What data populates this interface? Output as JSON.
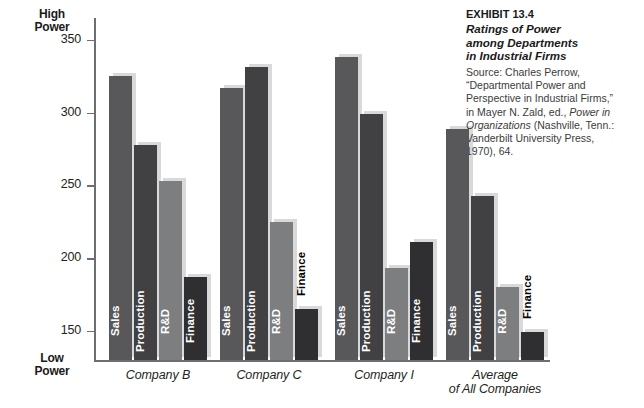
{
  "axis": {
    "top_cap": "High\nPower",
    "top_cap_line1": "High",
    "top_cap_line2": "Power",
    "bottom_cap_line1": "Low",
    "bottom_cap_line2": "Power",
    "ticks": [
      "350",
      "300",
      "250",
      "200",
      "150"
    ]
  },
  "exhibit": {
    "number": "EXHIBIT 13.4",
    "title_line1": "Ratings of Power",
    "title_line2": "among Departments",
    "title_line3": "in Industrial Firms",
    "source_l1": "Source: Charles Perrow,",
    "source_l2": "“Departmental Power and",
    "source_l3": "Perspective in Industrial Firms,”",
    "source_l4a": "in Mayer N. Zald, ed., ",
    "source_l4b": "Power in",
    "source_l5a": "Organizations",
    "source_l5b": " (Nashville, Tenn.:",
    "source_l6": "Vanderbilt University Press,",
    "source_l7": "1970), 64."
  },
  "colors": {
    "sales": "#58585a",
    "production": "#414042",
    "rnd": "#7d7e80",
    "finance": "#2f2f31",
    "shadow": "#d9d9d9",
    "axis": "#6d6e71",
    "text": "#231f20"
  },
  "chart_data": {
    "type": "bar",
    "title": "Ratings of Power among Departments in Industrial Firms",
    "xlabel": "",
    "ylabel": "Power (High Power / Low Power)",
    "ylim": [
      130,
      365
    ],
    "yticks": [
      150,
      200,
      250,
      300,
      350
    ],
    "grid": false,
    "legend": "none",
    "categories": [
      "Company B",
      "Company C",
      "Company I",
      "Average of All Companies"
    ],
    "series": [
      {
        "name": "Sales",
        "values": [
          325,
          317,
          338,
          289
        ]
      },
      {
        "name": "Production",
        "values": [
          278,
          331,
          299,
          243
        ]
      },
      {
        "name": "R&D",
        "values": [
          253,
          225,
          193,
          180
        ]
      },
      {
        "name": "Finance",
        "values": [
          187,
          165,
          211,
          149
        ]
      }
    ],
    "label_placement": {
      "Company B": [
        "inside",
        "inside",
        "inside",
        "inside"
      ],
      "Company C": [
        "inside",
        "inside",
        "inside",
        "outside"
      ],
      "Company I": [
        "inside",
        "inside",
        "inside",
        "inside"
      ],
      "Average of All Companies": [
        "inside",
        "inside",
        "inside",
        "outside"
      ]
    }
  },
  "groups": [
    {
      "caption_l1": "Company B",
      "caption_l2": ""
    },
    {
      "caption_l1": "Company C",
      "caption_l2": ""
    },
    {
      "caption_l1": "Company I",
      "caption_l2": ""
    },
    {
      "caption_l1": "Average",
      "caption_l2": "of All Companies"
    }
  ]
}
